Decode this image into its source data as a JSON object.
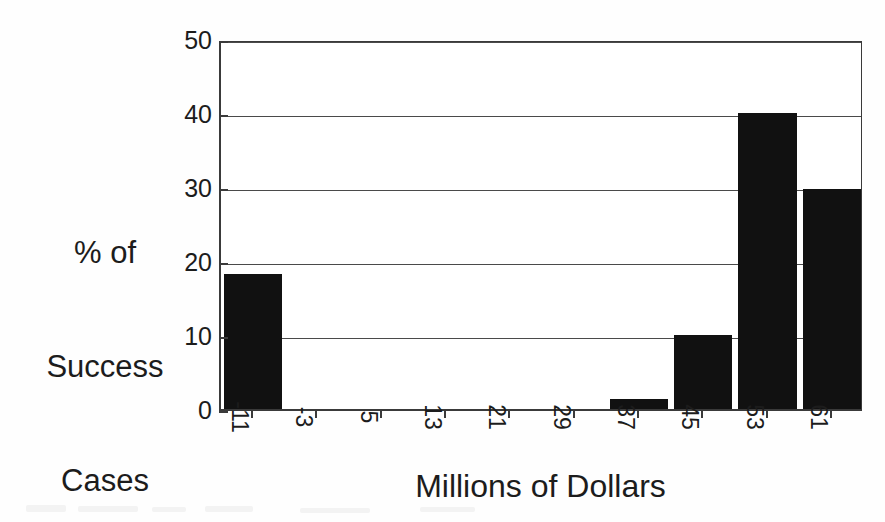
{
  "chart_data": {
    "type": "bar",
    "title": "",
    "subtitle": "",
    "xlabel": "Millions of Dollars",
    "ylabel": "% of Success Cases",
    "ylabel_lines": [
      "% of",
      "Success",
      "Cases"
    ],
    "categories": [
      "-11",
      "-3",
      "5",
      "13",
      "21",
      "29",
      "37",
      "45",
      "53",
      "61"
    ],
    "values": [
      18.3,
      0,
      0,
      0,
      0,
      0,
      1.4,
      10.0,
      40.0,
      29.7
    ],
    "ylim": [
      0,
      50
    ],
    "yticks": [
      0,
      10,
      20,
      30,
      40,
      50
    ],
    "ytick_labels": [
      "0",
      "10",
      "20",
      "30",
      "40",
      "50"
    ],
    "grid": true,
    "grid_axis": "y",
    "legend": "none",
    "bar_color": "#111111",
    "axis_color": "#3a3a3a",
    "background": "#ffffff"
  },
  "axis": {
    "x_title": "Millions of Dollars",
    "y_title_line1": "% of",
    "y_title_line2": "Success",
    "y_title_line3": "Cases"
  }
}
